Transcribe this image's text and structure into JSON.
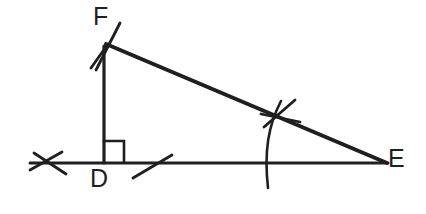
{
  "figure": {
    "background_color": "#ffffff",
    "ink_color": "#1f1f1f",
    "width": 426,
    "height": 214
  },
  "labels": {
    "vertex_f": "F",
    "vertex_d": "D",
    "vertex_e": "E"
  },
  "points": {
    "F": {
      "x": 105,
      "y": 45
    },
    "D": {
      "x": 104,
      "y": 163
    },
    "E": {
      "x": 386,
      "y": 163
    }
  },
  "segments": [
    {
      "name": "leg-DF",
      "x1": 104,
      "y1": 46,
      "x2": 104,
      "y2": 163,
      "stroke_width": 3.2
    },
    {
      "name": "base-line-DE",
      "x1": 30,
      "y1": 163,
      "x2": 388,
      "y2": 163,
      "stroke_width": 3.0
    },
    {
      "name": "hypotenuse-FE",
      "x1": 106,
      "y1": 44,
      "x2": 387,
      "y2": 163,
      "stroke_width": 4.0
    }
  ],
  "right_angle_mark": {
    "name": "right-angle-square-at-D",
    "points": "104,141 124,141 124,162",
    "stroke_width": 2.6
  },
  "construction_marks": [
    {
      "name": "arc-tick-f-upper",
      "x1": 120,
      "y1": 23,
      "x2": 96,
      "y2": 70,
      "stroke_width": 2.8
    },
    {
      "name": "arc-tick-f-lower",
      "x1": 91,
      "y1": 68,
      "x2": 108,
      "y2": 44,
      "stroke_width": 2.8
    },
    {
      "name": "arc-tick-left-a",
      "x1": 34,
      "y1": 153,
      "x2": 66,
      "y2": 174,
      "stroke_width": 2.8
    },
    {
      "name": "arc-tick-left-b",
      "x1": 30,
      "y1": 170,
      "x2": 62,
      "y2": 152,
      "stroke_width": 2.8
    },
    {
      "name": "arc-tick-right-a",
      "x1": 133,
      "y1": 178,
      "x2": 172,
      "y2": 155,
      "stroke_width": 2.8
    },
    {
      "name": "arc-tick-mid-a",
      "x1": 264,
      "y1": 127,
      "x2": 295,
      "y2": 100,
      "stroke_width": 2.8
    },
    {
      "name": "arc-tick-mid-b",
      "x1": 261,
      "y1": 114,
      "x2": 300,
      "y2": 122,
      "stroke_width": 2.8
    }
  ],
  "arcs": [
    {
      "name": "perpendicular-bisector-arc",
      "path": "M 281 101 C 268 126, 264 152, 268 188",
      "stroke_width": 2.6
    }
  ]
}
